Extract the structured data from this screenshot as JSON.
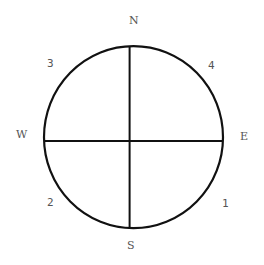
{
  "diagram": {
    "type": "compass",
    "stroke_color": "#111111",
    "label_color": "#555555",
    "directions": {
      "north": "N",
      "south": "S",
      "east": "E",
      "west": "W"
    },
    "quadrants": {
      "northeast": "4",
      "northwest": "3",
      "southwest": "2",
      "southeast": "1"
    }
  }
}
